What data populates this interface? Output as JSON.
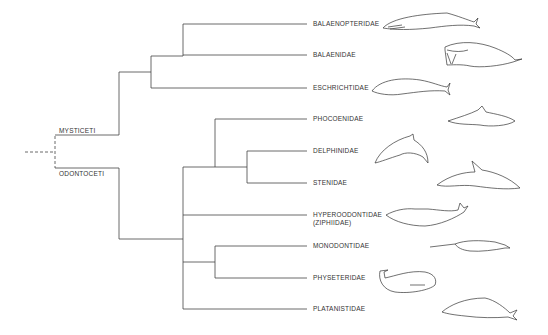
{
  "diagram": {
    "type": "phylogenetic-tree",
    "line_color": "#444444",
    "suborders": [
      {
        "id": "mysticeti",
        "label": "MYSTICETI"
      },
      {
        "id": "odontoceti",
        "label": "ODONTOCETI"
      }
    ],
    "families": [
      {
        "id": "balaenopteridae",
        "label": "BALAENOPTERIDAE",
        "suborder": "MYSTICETI"
      },
      {
        "id": "balaenidae",
        "label": "BALAENIDAE",
        "suborder": "MYSTICETI"
      },
      {
        "id": "eschrichtidae",
        "label": "ESCHRICHTIDAE",
        "suborder": "MYSTICETI"
      },
      {
        "id": "phocoenidae",
        "label": "PHOCOENIDAE",
        "suborder": "ODONTOCETI"
      },
      {
        "id": "delphinidae",
        "label": "DELPHINIDAE",
        "suborder": "ODONTOCETI"
      },
      {
        "id": "stenidae",
        "label": "STENIDAE",
        "suborder": "ODONTOCETI"
      },
      {
        "id": "hyperoodontidae",
        "label": "HYPEROODONTIDAE",
        "sublabel": "(ZIPHIIDAE)",
        "suborder": "ODONTOCETI"
      },
      {
        "id": "monodontidae",
        "label": "MONODONTIDAE",
        "suborder": "ODONTOCETI"
      },
      {
        "id": "physeteridae",
        "label": "PHYSETERIDAE",
        "suborder": "ODONTOCETI"
      },
      {
        "id": "platanistidae",
        "label": "PLATANISTIDAE",
        "suborder": "ODONTOCETI"
      }
    ],
    "illustrations": [
      "rorqual-whale-icon",
      "right-whale-icon",
      "gray-whale-icon",
      "porpoise-icon",
      "dolphin-icon",
      "rough-toothed-dolphin-icon",
      "beaked-whale-icon",
      "narwhal-icon",
      "sperm-whale-icon",
      "river-dolphin-icon"
    ]
  }
}
